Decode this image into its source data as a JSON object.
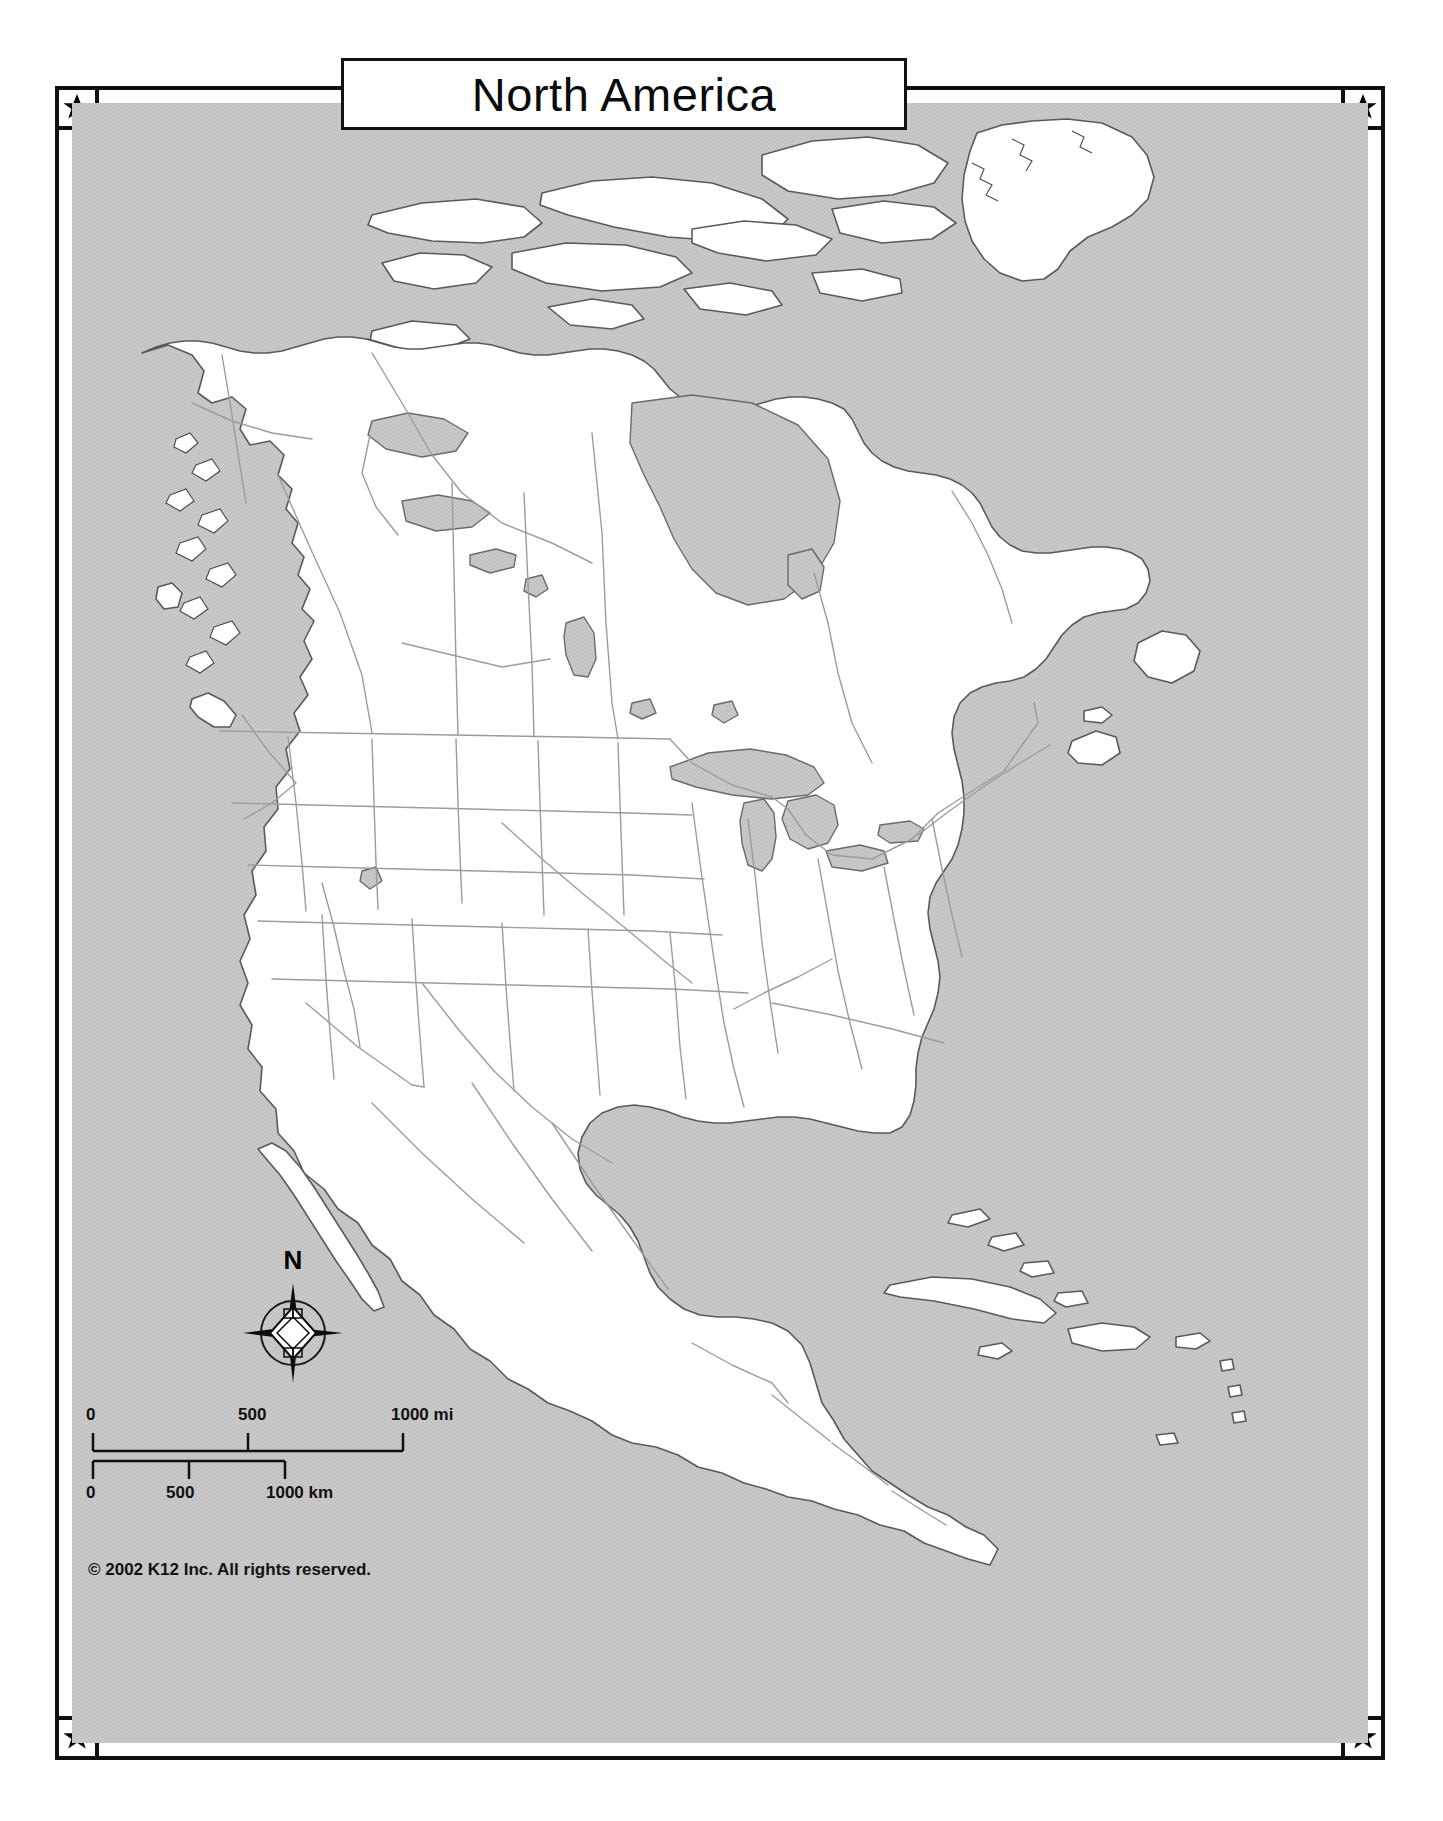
{
  "document": {
    "kind": "blank outline map worksheet",
    "title": "North America"
  },
  "title_plate": {
    "text": "North America"
  },
  "frame": {
    "corner_icon": "star-icon",
    "corner_count": 4,
    "border_color": "#111111",
    "style": "double-rule rectangle with star medallions at each corner"
  },
  "map": {
    "water_color": "#c9c9c9",
    "land_color": "#ffffff",
    "coastline_color": "#555555",
    "border_line_color": "#9a9a9a",
    "region": "North America, Central America and the Caribbean",
    "features": [
      "Greenland",
      "Canadian Arctic Archipelago",
      "Hudson Bay",
      "Canada",
      "United States",
      "Great Lakes",
      "Mexico",
      "Gulf of Mexico",
      "Florida",
      "Cuba",
      "Bahamas",
      "Hispaniola",
      "Central America",
      "Baja California",
      "Alaska panhandle coast",
      "Vancouver Island",
      "Newfoundland",
      "Labrador"
    ]
  },
  "compass": {
    "north_label": "N",
    "icon": "compass-rose-icon"
  },
  "scale": {
    "miles": {
      "unit_label": "1000 mi",
      "ticks": [
        "0",
        "500",
        "1000 mi"
      ],
      "values": [
        0,
        500,
        1000
      ]
    },
    "kilometers": {
      "unit_label": "1000 km",
      "ticks": [
        "0",
        "500",
        "1000 km"
      ],
      "values": [
        0,
        500,
        1000
      ]
    }
  },
  "copyright": {
    "text": "© 2002 K12 Inc. All rights reserved."
  }
}
